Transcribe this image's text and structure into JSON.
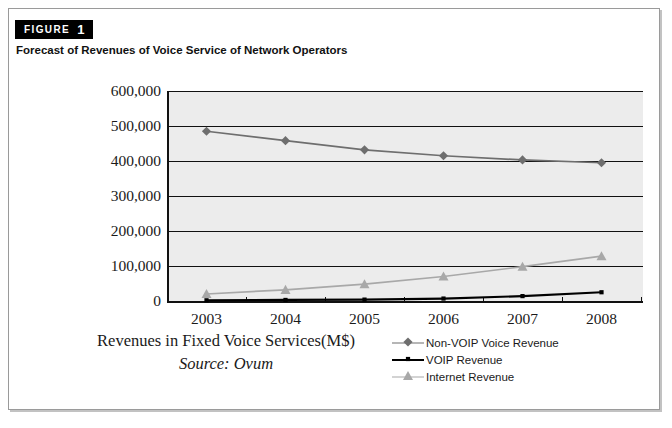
{
  "figure": {
    "badge_word": "FIGURE",
    "badge_number": "1",
    "title": "Forecast of Revenues of Voice Service of Network Operators"
  },
  "caption": {
    "axis_title": "Revenues in Fixed Voice Services(M$)",
    "source": "Source: Ovum"
  },
  "legend": {
    "position": "bottom-right",
    "items": [
      {
        "label": "Non-VOIP Voice Revenue",
        "color": "#6e6e6e",
        "marker": "diamond"
      },
      {
        "label": "VOIP Revenue",
        "color": "#000000",
        "marker": "square"
      },
      {
        "label": "Internet Revenue",
        "color": "#a8a8a8",
        "marker": "triangle"
      }
    ]
  },
  "colors": {
    "plot_background": "#ececec",
    "axis": "#111111",
    "non_voip": "#6e6e6e",
    "voip": "#000000",
    "internet": "#a8a8a8"
  },
  "chart_data": {
    "type": "line",
    "title": "Forecast of Revenues of Voice Service of Network Operators",
    "xlabel": "Revenues in Fixed Voice Services(M$)",
    "ylabel": "",
    "source": "Source: Ovum",
    "categories": [
      "2003",
      "2004",
      "2005",
      "2006",
      "2007",
      "2008"
    ],
    "x": [
      2003,
      2004,
      2005,
      2006,
      2007,
      2008
    ],
    "ylim": [
      0,
      600000
    ],
    "yticks": [
      0,
      100000,
      200000,
      300000,
      400000,
      500000,
      600000
    ],
    "ytick_labels": [
      "0",
      "100,000",
      "200,000",
      "300,000",
      "400,000",
      "500,000",
      "600,000"
    ],
    "grid": true,
    "legend_position": "bottom-right",
    "series": [
      {
        "name": "Non-VOIP Voice Revenue",
        "color": "#6e6e6e",
        "marker": "diamond",
        "values": [
          485000,
          458000,
          432000,
          415000,
          403000,
          395000
        ]
      },
      {
        "name": "VOIP Revenue",
        "color": "#000000",
        "marker": "square",
        "values": [
          2000,
          3000,
          4000,
          7000,
          14000,
          25000
        ]
      },
      {
        "name": "Internet Revenue",
        "color": "#a8a8a8",
        "marker": "triangle",
        "values": [
          20000,
          32000,
          48000,
          70000,
          98000,
          128000
        ]
      }
    ]
  }
}
